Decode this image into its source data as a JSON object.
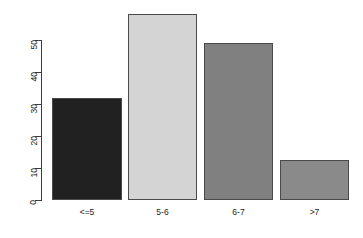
{
  "chart_data": {
    "type": "bar",
    "title": "",
    "subtitle": "",
    "xlabel": "",
    "ylabel": "",
    "categories": [
      "<=5",
      "5-6",
      "6-7",
      ">7"
    ],
    "values": [
      32,
      58,
      49,
      12.5
    ],
    "series": [
      {
        "name": "",
        "values": [
          32,
          58,
          49,
          12.5
        ]
      }
    ],
    "bar_colors": [
      "#212121",
      "#d4d4d4",
      "#808080",
      "#8a8a8a"
    ],
    "bar_border_color": "#4a4a4a",
    "ylim": [
      0,
      58
    ],
    "y_axis_range": [
      0,
      50
    ],
    "y_ticks": [
      0,
      10,
      20,
      30,
      40,
      50
    ],
    "y_tick_labels": [
      "0",
      "10",
      "20",
      "30",
      "40",
      "50"
    ],
    "x_tick_labels": [
      "<=5",
      "5-6",
      "6-7",
      ">7"
    ],
    "grid": false,
    "legend": false,
    "legend_position": "none",
    "background_color": "#ffffff",
    "axis_color": "#3d3d3d",
    "text_color": "#1a1a1a",
    "annotations": []
  }
}
